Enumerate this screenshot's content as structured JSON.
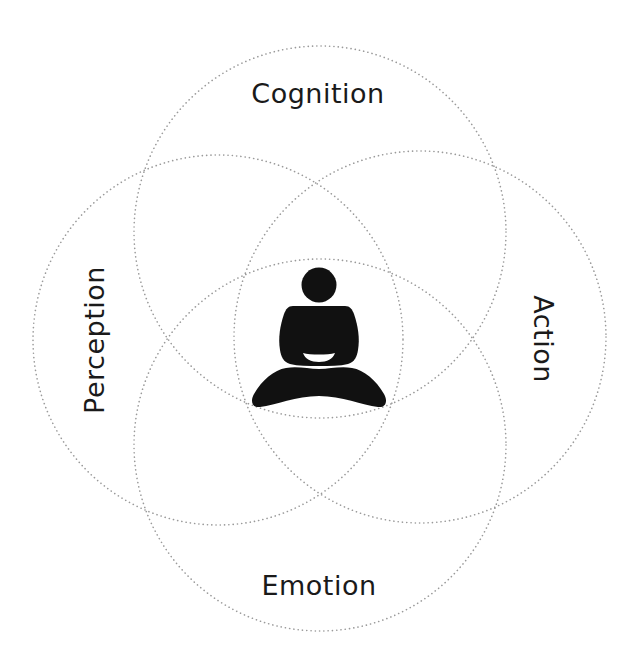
{
  "diagram": {
    "title": "",
    "colors": {
      "background": "#ffffff",
      "ring_stroke": "#9a9a9a",
      "text": "#1a1a1a",
      "figure": "#111111"
    },
    "circles": [
      {
        "id": "cognition",
        "cx": 320,
        "cy": 232,
        "r": 186
      },
      {
        "id": "perception",
        "cx": 218,
        "cy": 340,
        "r": 185
      },
      {
        "id": "action",
        "cx": 420,
        "cy": 337,
        "r": 186
      },
      {
        "id": "emotion",
        "cx": 320,
        "cy": 445,
        "r": 186
      }
    ],
    "labels": {
      "top": "Cognition",
      "left": "Perception",
      "right": "Action",
      "bottom": "Emotion"
    },
    "center_icon": "meditating-person-icon"
  }
}
